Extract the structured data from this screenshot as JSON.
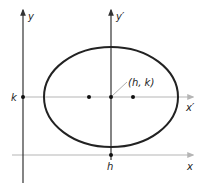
{
  "diagram": {
    "labels": {
      "y_axis": "y",
      "y_prime_axis": "y′",
      "x_axis": "x",
      "x_prime_axis": "x′",
      "k_tick": "k",
      "h_tick": "h",
      "center": "(h, k)"
    },
    "colors": {
      "ellipse": "#222222",
      "primary_axes": "#333333",
      "secondary_axes": "#b5b5b5",
      "points": "#111111",
      "leader_line": "#999999"
    },
    "geometry": {
      "center": [
        111,
        97
      ],
      "ellipse_rx": 67,
      "ellipse_ry": 50,
      "foci_x": [
        89,
        133
      ],
      "y_axis_x": 23,
      "x_axis_y": 155
    },
    "points": [
      {
        "name": "left-focus",
        "x": 89,
        "y": 97
      },
      {
        "name": "center",
        "x": 111,
        "y": 97
      },
      {
        "name": "right-focus",
        "x": 133,
        "y": 97
      },
      {
        "name": "k-point",
        "x": 23,
        "y": 97
      },
      {
        "name": "h-point",
        "x": 111,
        "y": 155
      }
    ]
  }
}
